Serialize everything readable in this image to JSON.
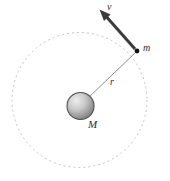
{
  "figure": {
    "name": "circular-orbit-diagram",
    "background_color": "#ffffff",
    "width": 170,
    "height": 181
  },
  "labels": {
    "velocity": "v",
    "orbiting_mass": "m",
    "radius": "r",
    "central_mass": "M"
  },
  "colors": {
    "orbit_path": "#b9b9b9",
    "radius_line": "#8a8a8a",
    "velocity_arrow": "#3b3b3b",
    "sphere_outline": "#4a4a4a",
    "sphere_light": "#e2e2e2",
    "sphere_dark": "#7d7d7d",
    "point_mass": "#111111",
    "label_text": "#2b2b2b"
  },
  "geometry": {
    "orbit_center_x": 79.5,
    "orbit_center_y": 100,
    "orbit_radius": 67.5,
    "orbit_dash": "2,3",
    "central_sphere_cx": 80.5,
    "central_sphere_cy": 106,
    "central_sphere_r": 13.5,
    "orbiting_point_x": 137,
    "orbiting_point_y": 51,
    "orbiting_point_r": 2.4,
    "velocity_tip_x": 100,
    "velocity_tip_y": 10,
    "velocity_tail_x": 135,
    "velocity_tail_y": 49
  }
}
